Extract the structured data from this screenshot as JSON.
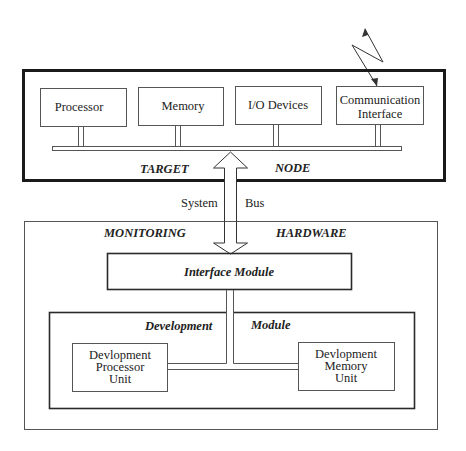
{
  "diagram": {
    "target_node": {
      "title_left": "TARGET",
      "title_right": "NODE",
      "components": [
        {
          "label_lines": [
            "Processor"
          ]
        },
        {
          "label_lines": [
            "Memory"
          ]
        },
        {
          "label_lines": [
            "I/O Devices"
          ]
        },
        {
          "label_lines": [
            "Communication",
            "Interface"
          ]
        }
      ]
    },
    "system_bus": {
      "label_left": "System",
      "label_right": "Bus"
    },
    "monitoring_hardware": {
      "title_left": "MONITORING",
      "title_right": "HARDWARE",
      "interface_module": {
        "label": "Interface Module"
      },
      "development_module": {
        "title_left": "Development",
        "title_right": "Module",
        "processor_unit": {
          "label_lines": [
            "Devlopment",
            "Processor",
            "Unit"
          ]
        },
        "memory_unit": {
          "label_lines": [
            "Devlopment",
            "Memory",
            "Unit"
          ]
        }
      }
    },
    "wireless_link": {
      "icon": "lightning-arrow-icon"
    }
  }
}
